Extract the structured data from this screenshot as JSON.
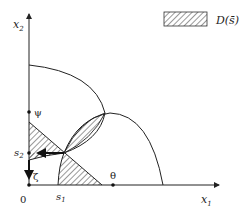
{
  "diagram": {
    "axes": {
      "x_label": "x",
      "x_label_sub": "1",
      "y_label": "x",
      "y_label_sub": "2",
      "origin_label": "0"
    },
    "points": {
      "s1": {
        "label": "s",
        "sub": "1"
      },
      "s2": {
        "label": "s",
        "sub": "2"
      },
      "psi": {
        "label": "ψ"
      },
      "theta": {
        "label": "θ"
      },
      "zeta": {
        "label": "ζ"
      }
    },
    "legend": {
      "label": "D(s̄)",
      "pattern": "diagonal-hatch"
    },
    "colors": {
      "stroke": "#222222",
      "background": "#ffffff"
    }
  }
}
